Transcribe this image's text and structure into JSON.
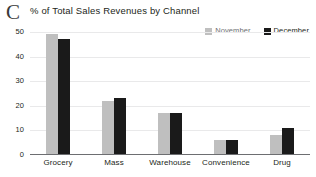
{
  "panel": {
    "label": "C"
  },
  "chart_data": {
    "type": "bar",
    "title": "% of Total Sales Revenues by Channel",
    "xlabel": "",
    "ylabel": "",
    "ylim": [
      0,
      50
    ],
    "yticks": [
      50,
      40,
      30,
      20,
      10,
      0
    ],
    "grid": true,
    "legend_position": "top-right",
    "categories": [
      "Grocery",
      "Mass",
      "Warehouse",
      "Convenience",
      "Drug"
    ],
    "series": [
      {
        "name": "November",
        "color": "#BFBFBF",
        "values": [
          49,
          22,
          17,
          6,
          8
        ]
      },
      {
        "name": "December",
        "color": "#1A1A1A",
        "values": [
          47,
          23,
          17,
          6,
          11
        ]
      }
    ]
  }
}
